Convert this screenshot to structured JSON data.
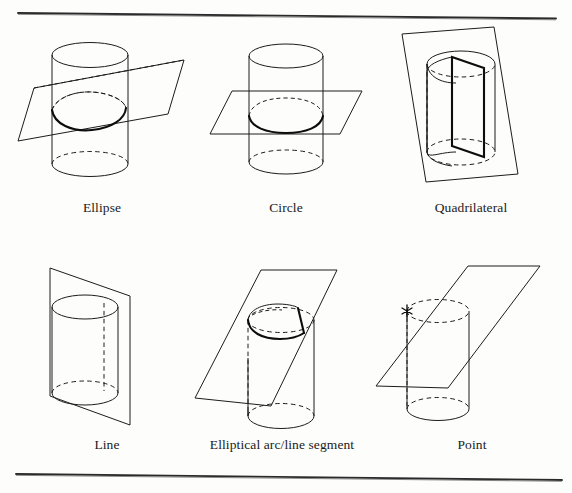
{
  "document": {
    "kind": "scanned-figure",
    "background_color": "#fdfdfc",
    "ink_color": "#1c1c1c",
    "highlight_color": "#0d0d0d",
    "top_rule": {
      "name": "top-horizontal-rule",
      "y_left": 13,
      "y_right": 18
    },
    "bottom_rule": {
      "name": "bottom-horizontal-rule",
      "y_left": 474,
      "y_right": 480
    }
  },
  "figure": {
    "rows": 2,
    "columns": 3,
    "panels": [
      {
        "id": "ellipse",
        "caption": "Ellipse",
        "description": "Oblique plane cutting completely through the cylinder, intersection is an ellipse",
        "plane_orientation": "oblique-tilted",
        "intersection_curve": "ellipse",
        "marker": "none"
      },
      {
        "id": "circle",
        "caption": "Circle",
        "description": "Horizontal plane perpendicular to the cylinder axis, intersection is a circle",
        "plane_orientation": "horizontal",
        "intersection_curve": "circle",
        "marker": "none"
      },
      {
        "id": "quadrilateral",
        "caption": "Quadrilateral",
        "description": "Vertical plane slicing through the cylinder parallel to the axis, intersection is a rectangle/quadrilateral",
        "plane_orientation": "vertical",
        "intersection_curve": "quadrilateral",
        "marker": "none"
      },
      {
        "id": "line",
        "caption": "Line",
        "description": "Vertical plane tangent to the cylinder along a ruling, intersection is a straight line",
        "plane_orientation": "vertical-tangent",
        "intersection_curve": "line",
        "marker": "none"
      },
      {
        "id": "elliptical-arc-line-segment",
        "caption": "Elliptical arc/line segment",
        "description": "Oblique plane cutting the top rim of the cylinder, intersection is an elliptical arc plus a line segment",
        "plane_orientation": "oblique",
        "intersection_curve": "elliptical arc and line segment",
        "marker": "none"
      },
      {
        "id": "point",
        "caption": "Point",
        "description": "Oblique plane touching the cylinder at a single tangent point marked with an asterisk",
        "plane_orientation": "oblique-tangent",
        "intersection_curve": "point",
        "marker": "asterisk"
      }
    ]
  },
  "captions": {
    "row1": [
      "Ellipse",
      "Circle",
      "Quadrilateral"
    ],
    "row2": [
      "Line",
      "Elliptical arc/line segment",
      "Point"
    ]
  }
}
